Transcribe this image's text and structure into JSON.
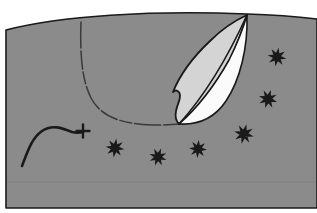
{
  "canvas": {
    "width": 317,
    "height": 213,
    "background_color": "#ffffff",
    "title": "Leaf cross-section line illustration"
  },
  "palette": {
    "page_background": "#ffffff",
    "field_gray": "#8b8b8b",
    "leaf_light_gray": "#d4d4d4",
    "leaf_white": "#fbfbfb",
    "ink_black": "#1a1a1a",
    "faint_line": "#7a7a7a"
  },
  "shapes": {
    "field": {
      "label": "gray background field",
      "path": "M 6,30 C 60,16 150,10 247,14 C 280,15 300,17 317,19 L 317,208 L 6,208 Z",
      "fill": "#8b8b8b",
      "stroke": "#1a1a1a",
      "stroke_width": 1.6
    },
    "leaf_outer": {
      "label": "leaf outline",
      "path": "M 247,15 C 238,46 222,80 204,101 C 196,110 188,118 179,124 C 176,121 175,116 176,111 C 177,105 180,101 180,96 C 180,91 176,89 173,92 C 179,77 192,58 210,41 C 222,29 236,20 247,15 Z",
      "fill": "#d4d4d4",
      "stroke": "#1a1a1a",
      "stroke_width": 1.8
    },
    "leaf_white_half": {
      "label": "leaf white half",
      "path": "M 247,15 C 248,48 240,80 226,101 C 214,119 197,125 179,124 C 196,109 215,85 229,60 C 236,46 243,29 247,15 Z",
      "fill": "#fbfbfb",
      "stroke": "#1a1a1a",
      "stroke_width": 1.6
    },
    "leaf_midrib": {
      "label": "leaf midrib diagonal",
      "path": "M 247,15 C 232,48 208,92 179,124",
      "stroke": "#1a1a1a",
      "stroke_width": 1.6
    },
    "bowl_curve": {
      "label": "dashed bowl curve",
      "path": "M 81,22 C 80,50 81,78 91,98 C 101,117 122,124 152,125 C 162,125 171,125 179,124",
      "stroke": "#3a3a3a",
      "stroke_width": 1.5,
      "dash": "26 3 18 3 12 3"
    },
    "squiggle": {
      "label": "s-curve squiggle",
      "path": "M 22,166 C 28,150 32,138 42,131 C 52,124 62,128 72,132 C 76,133 79,133 83,132",
      "stroke": "#1a1a1a",
      "stroke_width": 2.6
    },
    "cross_marker": {
      "label": "cross marker",
      "x": 83,
      "y": 131,
      "arm": 6.5,
      "stroke": "#1a1a1a",
      "stroke_width": 2.4
    },
    "baseline": {
      "label": "faint baseline",
      "path": "M 7,182 L 316,182",
      "stroke": "#7e7e7e",
      "stroke_width": 1
    }
  },
  "stars": {
    "label": "eight-pointed asterisk markers",
    "color": "#1a1a1a",
    "items": [
      {
        "name": "star-lower-1",
        "x": 115,
        "y": 148,
        "r": 9.5,
        "rotate": 8
      },
      {
        "name": "star-lower-2",
        "x": 158,
        "y": 157,
        "r": 9.0,
        "rotate": 20
      },
      {
        "name": "star-lower-3",
        "x": 198,
        "y": 149,
        "r": 9.0,
        "rotate": 5
      },
      {
        "name": "star-lower-4",
        "x": 244,
        "y": 134,
        "r": 10.0,
        "rotate": 14
      },
      {
        "name": "star-right-1",
        "x": 277,
        "y": 57,
        "r": 9.5,
        "rotate": 10
      },
      {
        "name": "star-right-2",
        "x": 268,
        "y": 99,
        "r": 9.5,
        "rotate": 18
      }
    ]
  },
  "accessibility": {
    "description": "Gray rectangular field with a pointed leaf shape split into a light gray half and a white half, a dashed bowl-shaped curve at the left, an S-shaped squiggle ending in a small cross, and six black eight-pointed star markers."
  }
}
